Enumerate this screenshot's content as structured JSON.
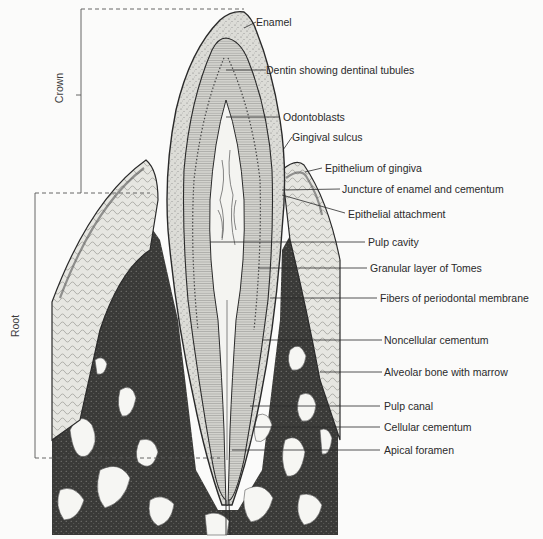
{
  "figure": {
    "regions": [
      {
        "id": "crown",
        "label": "Crown"
      },
      {
        "id": "root",
        "label": "Root"
      }
    ],
    "labels": [
      {
        "id": "enamel",
        "text": "Enamel"
      },
      {
        "id": "dentin",
        "text": "Dentin showing dentinal tubules"
      },
      {
        "id": "odontoblasts",
        "text": "Odontoblasts"
      },
      {
        "id": "gingival-sulcus",
        "text": "Gingival sulcus"
      },
      {
        "id": "epithelium-gingiva",
        "text": "Epithelium of gingiva"
      },
      {
        "id": "juncture",
        "text": "Juncture of enamel and cementum"
      },
      {
        "id": "epithelial-attachment",
        "text": "Epithelial attachment"
      },
      {
        "id": "pulp-cavity",
        "text": "Pulp cavity"
      },
      {
        "id": "granular-layer",
        "text": "Granular layer of Tomes"
      },
      {
        "id": "periodontal-fibers",
        "text": "Fibers of periodontal membrane"
      },
      {
        "id": "noncellular-cementum",
        "text": "Noncellular cementum"
      },
      {
        "id": "alveolar-bone",
        "text": "Alveolar bone with marrow"
      },
      {
        "id": "pulp-canal",
        "text": "Pulp canal"
      },
      {
        "id": "cellular-cementum",
        "text": "Cellular cementum"
      },
      {
        "id": "apical-foramen",
        "text": "Apical foramen"
      }
    ]
  },
  "colors": {
    "ink": "#2a2a2a",
    "bone": "#3b3b3b",
    "enamel": "#d6d6d2",
    "dentin": "#c9c9c4",
    "pulp": "#f4f4f1",
    "gum": "#e2e2dd",
    "paper": "#fbfbfa"
  }
}
